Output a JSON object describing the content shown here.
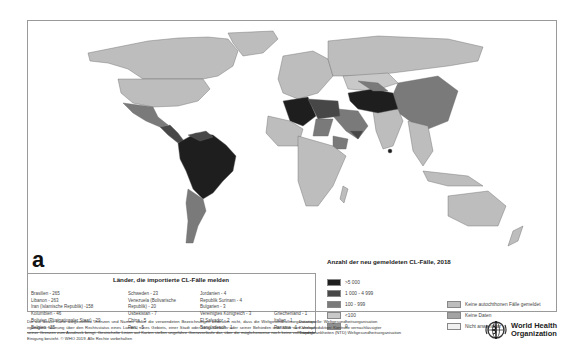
{
  "panel_label": "a",
  "map": {
    "description": "World choropleth map of newly reported cutaneous leishmaniasis (CL) cases, 2018",
    "colors": {
      "gt_5000": "#1e1e1e",
      "r1000_4999": "#474747",
      "r100_999": "#7a7a7a",
      "lt_100": "#c4c4c4",
      "zero": "#8f8f8f",
      "no_autochthonous": "#b9b9b9",
      "no_data": "#a3a3a3",
      "not_applicable": "#efefef"
    }
  },
  "imported_cases": {
    "title": "Länder, die importierte CL-Fälle melden",
    "columns": [
      [
        "Brasilien - 265",
        "Libanon - 263",
        "Iran (Islamische Republik) -158",
        "Kolumbien - 46",
        "Bolivien (Plurinationaler Staat) - 29",
        "Belgien - 25"
      ],
      [
        "Schweden - 23",
        "Venezuela (Bolivarische",
        "Republik) - 20",
        "Usbekistan - 7",
        "China - 5",
        "Peru - 5"
      ],
      [
        "Jordanien - 4",
        "Republik Surinam - 4",
        "Bulgarien - 3",
        "Vereinigtes Königreich - 3",
        "El Salvador - 2",
        "Bangladesch - 1"
      ],
      [
        "",
        "",
        "",
        "Griechenland - 1",
        "Italien - 1",
        "Panama - 1"
      ]
    ]
  },
  "legend": {
    "title": "Anzahl der neu gemeldeten CL-Fälle, 2018",
    "classes": [
      {
        "label": ">5 000",
        "color": "#1e1e1e"
      },
      {
        "label": "1 000 - 4 999",
        "color": "#474747"
      },
      {
        "label": "100 - 999",
        "color": "#7a7a7a"
      },
      {
        "label": "<100",
        "color": "#c8c8c8"
      },
      {
        "label": "0",
        "color": "#8f8f8f"
      }
    ],
    "other": [
      {
        "label": "Keine autochthonen Fälle gemeldet",
        "color": "#bdbdbd"
      },
      {
        "label": "Keine Daten",
        "color": "#a3a3a3"
      },
      {
        "label": "Nicht anwendbar",
        "color": "#f0f0f0"
      }
    ]
  },
  "footer": {
    "disclaimer": "Die auf dieser Karte dargestellten Grenzen und Namen sowie die verwendeten Bezeichnungen bedeuten nicht, dass die Weltgesundheitsorganisation irgendeine Meinung über den Rechtsstatus eines Landes, eines Gebiets, einer Stadt oder eines Gebiets oder seiner Behörden oder über den Verlauf seiner Grenzen zum Ausdruck bringt. Gestrichelte Linien auf Karten stellen ungefähre Grenzverläufe dar, über die möglicherweise noch keine vollständige Einigung besteht. © WHO 2019. Alle Rechte vorbehalten",
    "source_lines": [
      "Datenquelle: Weltgesundheitsorganisation",
      "Kartenproduktion: Kontrolle vernachlässigter",
      "Tropenkrankheiten (NTD) Weltgesundheitsorganisation"
    ],
    "logo_line1": "World Health",
    "logo_line2": "Organization"
  }
}
